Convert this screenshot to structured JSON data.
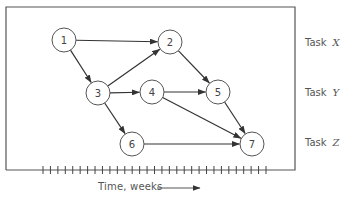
{
  "diagram": {
    "type": "activity-network",
    "colors": {
      "stroke": "#555555",
      "node_fill": "#ffffff",
      "text": "#444444"
    },
    "frame": {
      "left": 6,
      "top": 7,
      "right": 295,
      "bottom": 170
    },
    "node_radius": 12,
    "nodes": [
      {
        "id": "1",
        "label": "1",
        "x": 64,
        "y": 40
      },
      {
        "id": "2",
        "label": "2",
        "x": 170,
        "y": 42
      },
      {
        "id": "3",
        "label": "3",
        "x": 98,
        "y": 93
      },
      {
        "id": "4",
        "label": "4",
        "x": 152,
        "y": 92
      },
      {
        "id": "5",
        "label": "5",
        "x": 218,
        "y": 92
      },
      {
        "id": "6",
        "label": "6",
        "x": 132,
        "y": 144
      },
      {
        "id": "7",
        "label": "7",
        "x": 252,
        "y": 144
      }
    ],
    "edges": [
      {
        "from": "1",
        "to": "2"
      },
      {
        "from": "1",
        "to": "3"
      },
      {
        "from": "3",
        "to": "2"
      },
      {
        "from": "3",
        "to": "4"
      },
      {
        "from": "3",
        "to": "6"
      },
      {
        "from": "2",
        "to": "5"
      },
      {
        "from": "4",
        "to": "5"
      },
      {
        "from": "4",
        "to": "7"
      },
      {
        "from": "5",
        "to": "7"
      },
      {
        "from": "6",
        "to": "7"
      }
    ],
    "tasks": [
      {
        "label": "Task",
        "var": "X",
        "y": 43
      },
      {
        "label": "Task",
        "var": "Y",
        "y": 93
      },
      {
        "label": "Task",
        "var": "Z",
        "y": 143
      }
    ],
    "time_axis": {
      "label": "Time, weeks",
      "tick_start_x": 43,
      "tick_end_x": 266,
      "tick_count": 31,
      "y": 170
    }
  }
}
